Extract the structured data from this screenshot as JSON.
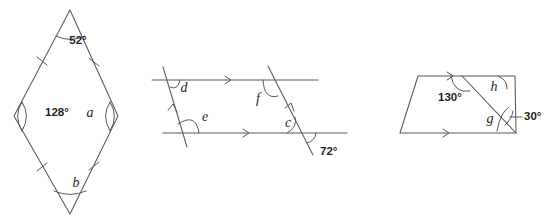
{
  "sheet": {
    "title": "Geometry angle problems",
    "background_color": "#ffffff",
    "stroke_color": "#58585a",
    "text_color": "#231f20",
    "width": 555,
    "height": 223
  },
  "figures": [
    {
      "id": "figure-1",
      "name": "rhombus",
      "shape": "rhombus",
      "description": "Rhombus with four equal sides marked by single tick marks",
      "tick_marks": 4,
      "labels": [
        {
          "key": "top_angle",
          "text": "52°",
          "kind": "measure",
          "x": 78,
          "y": 44,
          "anchor": "middle"
        },
        {
          "key": "left_angle",
          "text": "128°",
          "kind": "measure",
          "x": 45,
          "y": 116,
          "anchor": "start"
        },
        {
          "key": "right_angle",
          "text": "a",
          "kind": "variable",
          "x": 90,
          "y": 117,
          "anchor": "middle"
        },
        {
          "key": "bottom_angle",
          "text": "b",
          "kind": "variable",
          "x": 76,
          "y": 187,
          "anchor": "middle"
        }
      ]
    },
    {
      "id": "figure-2",
      "name": "parallel-lines-transversals",
      "shape": "two parallel lines cut by two parallel transversals",
      "description": "Two horizontal parallel lines with single arrow markers crossed by two parallel transversals with single arrow markers",
      "parallel_marks": {
        "horizontal_lines": 2,
        "transversals": 2
      },
      "labels": [
        {
          "key": "angle_d",
          "text": "d",
          "kind": "variable",
          "x": 184,
          "y": 92,
          "anchor": "middle"
        },
        {
          "key": "angle_e",
          "text": "e",
          "kind": "variable",
          "x": 205,
          "y": 121,
          "anchor": "middle"
        },
        {
          "key": "angle_f",
          "text": "f",
          "kind": "variable",
          "x": 258,
          "y": 103,
          "anchor": "middle"
        },
        {
          "key": "angle_c",
          "text": "c",
          "kind": "variable",
          "x": 288,
          "y": 127,
          "anchor": "middle"
        },
        {
          "key": "angle_seventy2",
          "text": "72°",
          "kind": "measure",
          "x": 320,
          "y": 155,
          "anchor": "start"
        }
      ]
    },
    {
      "id": "figure-3",
      "name": "trapezium-with-diagonal",
      "shape": "trapezium with a diagonal",
      "description": "Trapezium with parallel top and bottom edges marked by single arrows, crossed by a diagonal",
      "parallel_marks": {
        "horizontal_lines": 2
      },
      "labels": [
        {
          "key": "angle_130",
          "text": "130°",
          "kind": "measure",
          "x": 438,
          "y": 101,
          "anchor": "start"
        },
        {
          "key": "angle_h",
          "text": "h",
          "kind": "variable",
          "x": 494,
          "y": 91,
          "anchor": "middle"
        },
        {
          "key": "angle_g",
          "text": "g",
          "kind": "variable",
          "x": 490,
          "y": 123,
          "anchor": "middle"
        },
        {
          "key": "angle_thirty",
          "text": "30°",
          "kind": "measure",
          "x": 524,
          "y": 120,
          "anchor": "start"
        }
      ]
    }
  ]
}
